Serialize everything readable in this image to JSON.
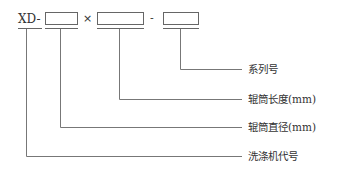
{
  "code": {
    "prefix": "XD-",
    "times_sign": "×",
    "dash": "-"
  },
  "labels": [
    {
      "id": "series",
      "text": "系列号"
    },
    {
      "id": "roller-length",
      "text": "辊筒长度(mm)"
    },
    {
      "id": "roller-diameter",
      "text": "辊筒直径(mm)"
    },
    {
      "id": "machine-code",
      "text": "洗涤机代号"
    }
  ],
  "colors": {
    "line": "#777777",
    "text": "#333333"
  }
}
